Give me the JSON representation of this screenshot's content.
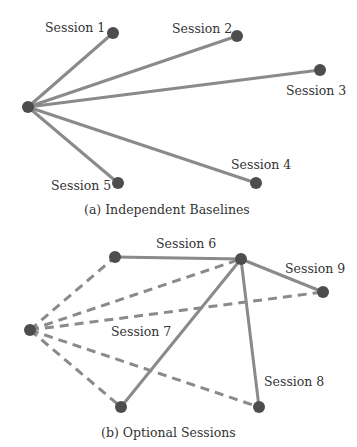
{
  "colors": {
    "edge": "#8a8a8a",
    "node": "#4d4d4d",
    "text": "#333333",
    "background": "#ffffff"
  },
  "diagram_a": {
    "caption": "(a) Independent Baselines",
    "root": {
      "x": 28,
      "y": 107
    },
    "sessions": [
      {
        "label": "Session 1",
        "x": 113,
        "y": 33
      },
      {
        "label": "Session 2",
        "x": 237,
        "y": 36
      },
      {
        "label": "Session 3",
        "x": 320,
        "y": 70
      },
      {
        "label": "Session 4",
        "x": 256,
        "y": 183
      },
      {
        "label": "Session 5",
        "x": 118,
        "y": 183
      }
    ]
  },
  "diagram_b": {
    "caption": "(b) Optional Sessions",
    "root": {
      "x": 30,
      "y": 330
    },
    "hub": {
      "x": 241,
      "y": 259
    },
    "labels": {
      "s6": "Session 6",
      "s7": "Session 7",
      "s8": "Session 8",
      "s9": "Session 9"
    },
    "nodes": [
      {
        "id": "n6",
        "x": 115,
        "y": 257
      },
      {
        "id": "n9",
        "x": 323,
        "y": 292
      },
      {
        "id": "n7",
        "x": 121,
        "y": 407
      },
      {
        "id": "n8",
        "x": 259,
        "y": 407
      }
    ]
  }
}
